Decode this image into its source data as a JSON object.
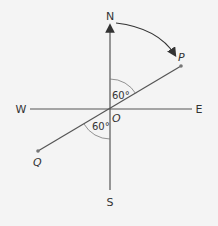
{
  "diagram": {
    "compass": {
      "north": "N",
      "south": "S",
      "east": "E",
      "west": "W"
    },
    "origin_label": "O",
    "points": {
      "p": "P",
      "q": "Q"
    },
    "angles": {
      "upper": "60°",
      "lower": "60°"
    },
    "colors": {
      "background": "#f4f4f4",
      "line": "#555555",
      "text": "#333333"
    }
  }
}
